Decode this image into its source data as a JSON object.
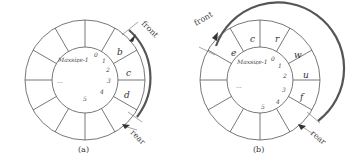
{
  "figure": {
    "panels": [
      {
        "id": "a",
        "caption": "(a)",
        "max_label": "Maxsize-1",
        "indices": [
          "0",
          "1",
          "2",
          "3",
          "4",
          "5"
        ],
        "ellipsis": "...",
        "cells": [
          "b",
          "c",
          "d"
        ],
        "front_label": "front",
        "rear_label": "rear"
      },
      {
        "id": "b",
        "caption": "(b)",
        "max_label": "Maxsize-1",
        "indices": [
          "0",
          "1",
          "2",
          "3",
          "4",
          "5"
        ],
        "ellipsis": "...",
        "cells": [
          "e",
          "c",
          "r",
          "w",
          "u",
          "f"
        ],
        "front_label": "front",
        "rear_label": "rear"
      }
    ]
  }
}
